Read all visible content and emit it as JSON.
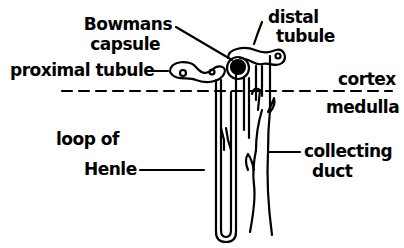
{
  "diagram": {
    "labels": {
      "bowmans_capsule_line1": "Bowmans",
      "bowmans_capsule_line2": "capsule",
      "proximal_tubule": "proximal tubule",
      "distal_tubule_line1": "distal",
      "distal_tubule_line2": "tubule",
      "cortex": "cortex",
      "medulla": "medulla",
      "loop_of_henle_line1": "loop of",
      "loop_of_henle_line2": "Henle",
      "collecting_duct_line1": "collecting",
      "collecting_duct_line2": "duct"
    },
    "colors": {
      "line": "#000000",
      "background": "#ffffff"
    }
  }
}
